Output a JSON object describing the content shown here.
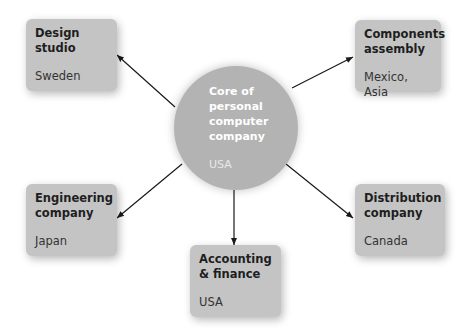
{
  "core": {
    "title": "Core of\npersonal\ncomputer\ncompany",
    "location": "USA"
  },
  "nodes": [
    {
      "id": "design-studio",
      "title": "Design\nstudio",
      "location": "Sweden"
    },
    {
      "id": "components-assembly",
      "title": "Components\nassembly",
      "location": "Mexico, Asia"
    },
    {
      "id": "engineering-company",
      "title": "Engineering\ncompany",
      "location": "Japan"
    },
    {
      "id": "accounting-finance",
      "title": "Accounting\n& finance",
      "location": "USA"
    },
    {
      "id": "distribution-company",
      "title": "Distribution\ncompany",
      "location": "Canada"
    }
  ],
  "colors": {
    "box": "#c4c4c4",
    "core": "#b3b3b3",
    "arrow": "#1a1a1a"
  }
}
